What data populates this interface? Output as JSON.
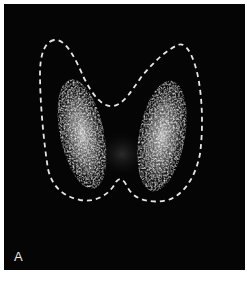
{
  "figure": {
    "panel_label": "A",
    "colors": {
      "background": "#050505",
      "outline": "#e6e6e6",
      "uptake": "#cfcfcf"
    }
  }
}
